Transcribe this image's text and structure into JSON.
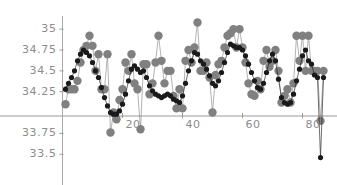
{
  "chart_data": {
    "type": "line",
    "title": "",
    "subtitle": "",
    "xlabel": "",
    "ylabel": "",
    "xlim": [
      0,
      88
    ],
    "ylim": [
      33.42,
      35.12
    ],
    "grid": false,
    "legend": "none",
    "axis_origin_y": 34.0,
    "x_ticks": [
      20,
      40,
      60,
      80
    ],
    "x_tick_labels": [
      "20",
      "40",
      "60",
      "80"
    ],
    "y_ticks": [
      33.5,
      33.75,
      34.25,
      34.5,
      34.75,
      35
    ],
    "y_tick_labels": [
      "33.5",
      "33.75",
      "34.25",
      "34.5",
      "34.75",
      "35"
    ],
    "colors": {
      "series_gray": "#808080",
      "series_black": "#1a1a1a",
      "axis": "#999999",
      "tick_text": "#8c8c8c",
      "background": "#ffffff"
    },
    "marker_sizes": {
      "series_gray": 4.2,
      "series_black": 2.6
    },
    "x": [
      1,
      2,
      3,
      4,
      5,
      6,
      7,
      8,
      9,
      10,
      11,
      12,
      13,
      14,
      15,
      16,
      17,
      18,
      19,
      20,
      21,
      22,
      23,
      24,
      25,
      26,
      27,
      28,
      29,
      30,
      31,
      32,
      33,
      34,
      35,
      36,
      37,
      38,
      39,
      40,
      41,
      42,
      43,
      44,
      45,
      46,
      47,
      48,
      49,
      50,
      51,
      52,
      53,
      54,
      55,
      56,
      57,
      58,
      59,
      60,
      61,
      62,
      63,
      64,
      65,
      66,
      67,
      68,
      69,
      70,
      71,
      72,
      73,
      74,
      75,
      76,
      77,
      78,
      79,
      80,
      81,
      82,
      83,
      84,
      85,
      86,
      87
    ],
    "series": [
      {
        "name": "gray",
        "color": "#808080",
        "marker": "circle",
        "values": [
          34.1,
          34.28,
          34.28,
          34.28,
          34.38,
          34.6,
          34.75,
          34.8,
          34.92,
          34.8,
          34.5,
          34.7,
          34.28,
          34.28,
          34.7,
          33.76,
          34.0,
          33.92,
          34.15,
          34.28,
          34.6,
          34.5,
          34.7,
          34.35,
          34.28,
          33.8,
          34.58,
          34.58,
          34.22,
          34.35,
          34.6,
          34.92,
          34.62,
          34.35,
          34.5,
          34.5,
          34.2,
          34.05,
          34.28,
          34.05,
          34.62,
          34.75,
          34.6,
          34.78,
          35.08,
          34.5,
          34.5,
          34.6,
          34.42,
          34.0,
          34.45,
          34.58,
          34.62,
          34.78,
          34.92,
          34.95,
          35.0,
          34.78,
          35.0,
          34.78,
          34.6,
          34.35,
          34.22,
          34.2,
          34.38,
          34.28,
          34.62,
          34.75,
          34.55,
          34.62,
          34.75,
          34.5,
          34.12,
          34.2,
          34.28,
          34.12,
          34.35,
          34.92,
          34.62,
          34.92,
          34.5,
          34.92,
          34.5,
          34.5,
          34.5,
          33.9,
          34.5
        ]
      },
      {
        "name": "black",
        "color": "#1a1a1a",
        "marker": "circle",
        "values": [
          34.28,
          34.35,
          34.42,
          34.5,
          34.62,
          34.7,
          34.75,
          34.72,
          34.68,
          34.6,
          34.5,
          34.42,
          34.3,
          34.18,
          34.08,
          34.0,
          33.98,
          33.98,
          34.02,
          34.1,
          34.22,
          34.38,
          34.52,
          34.56,
          34.52,
          34.48,
          34.5,
          34.42,
          34.32,
          34.26,
          34.22,
          34.2,
          34.18,
          34.2,
          34.22,
          34.2,
          34.16,
          34.14,
          34.12,
          34.2,
          34.35,
          34.5,
          34.62,
          34.72,
          34.7,
          34.62,
          34.58,
          34.52,
          34.44,
          34.35,
          34.32,
          34.38,
          34.48,
          34.6,
          34.72,
          34.82,
          34.8,
          34.78,
          34.78,
          34.75,
          34.68,
          34.58,
          34.48,
          34.38,
          34.3,
          34.28,
          34.35,
          34.48,
          34.62,
          34.7,
          34.62,
          34.4,
          34.18,
          34.12,
          34.1,
          34.12,
          34.22,
          34.38,
          34.52,
          34.68,
          34.75,
          34.62,
          34.58,
          34.45,
          34.42,
          33.46,
          34.42
        ]
      }
    ]
  }
}
